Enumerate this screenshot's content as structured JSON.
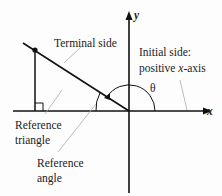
{
  "diagram": {
    "labels": {
      "terminal_side": "Terminal side",
      "initial_side_line1": "Initial side:",
      "initial_side_line2_prefix": "positive ",
      "initial_side_line2_var": "x",
      "initial_side_line2_suffix": "-axis",
      "theta": "θ",
      "reference_triangle_line1": "Reference",
      "reference_triangle_line2": "triangle",
      "reference_angle_line1": "Reference",
      "reference_angle_line2": "angle",
      "x_axis": "x",
      "y_axis": "y"
    },
    "colors": {
      "axis": "#111111",
      "leader": "#999999",
      "text": "#222222"
    }
  }
}
